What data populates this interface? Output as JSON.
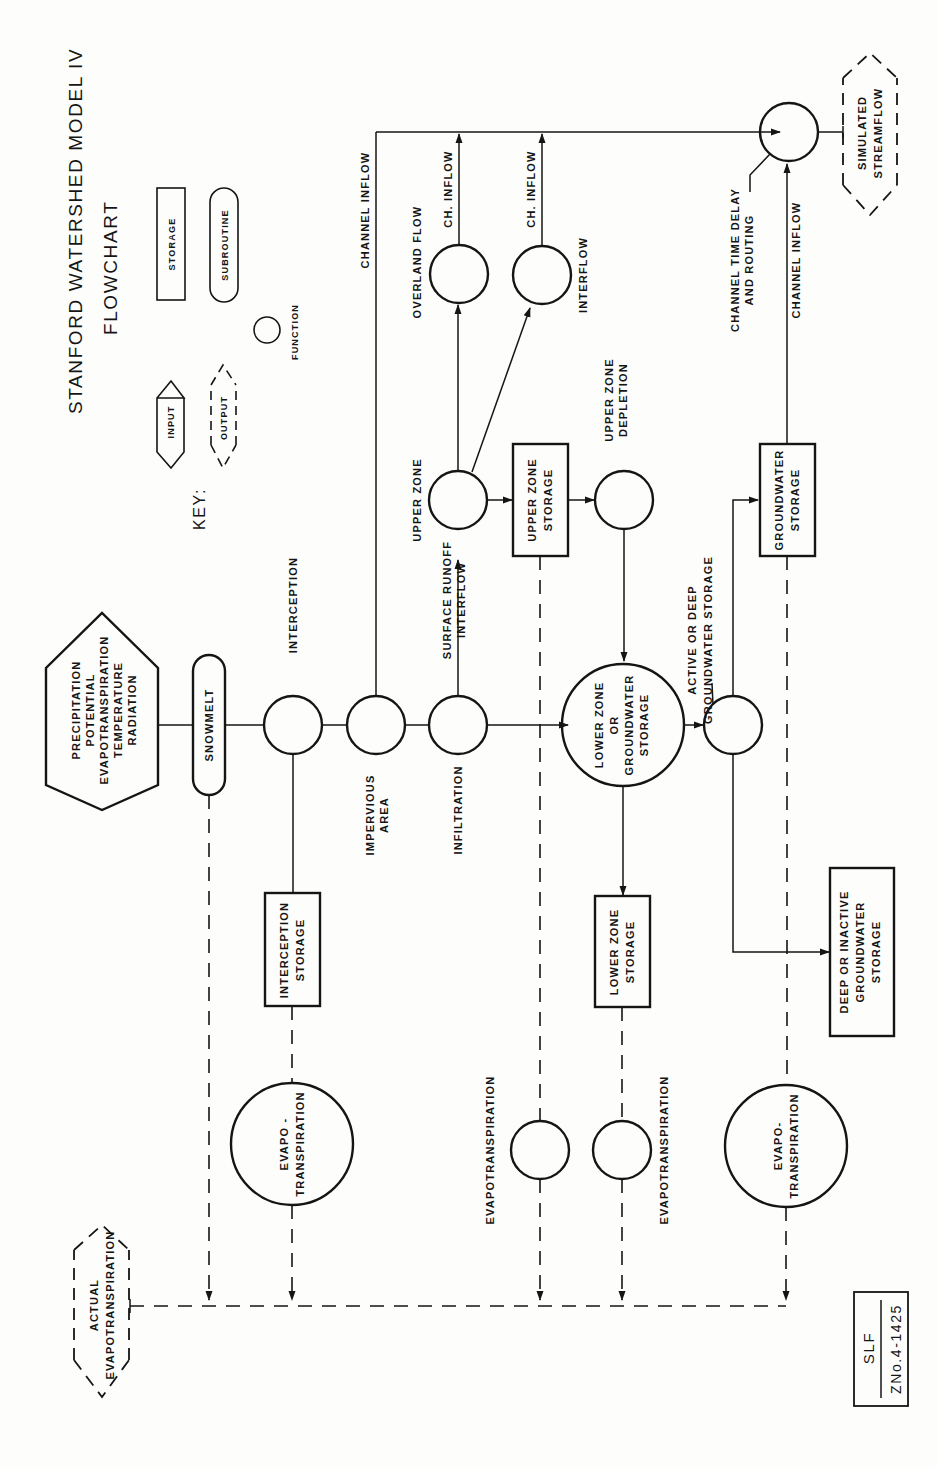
{
  "diagram": {
    "title": "STANFORD WATERSHED MODEL IV",
    "subtitle": "FLOWCHART",
    "stamp": {
      "line1": "SLF",
      "line2": "ZNo.4-1425"
    }
  },
  "key": {
    "label": "KEY:",
    "items": [
      {
        "shape": "hexagon",
        "label": "INPUT"
      },
      {
        "shape": "rectangle",
        "label": "STORAGE"
      },
      {
        "shape": "dashed-hexagon",
        "label": "OUTPUT"
      },
      {
        "shape": "rounded",
        "label": "SUBROUTINE"
      },
      {
        "shape": "circle",
        "label": "FUNCTION"
      }
    ]
  },
  "nodes": {
    "input": {
      "lines": [
        "PRECIPITATION",
        "POTENTIAL",
        "EVAPOTRANSPIRATION",
        "TEMPERATURE",
        "RADIATION"
      ]
    },
    "snowmelt": {
      "label": "SNOWMELT"
    },
    "interception": {
      "label": "INTERCEPTION"
    },
    "impervious": {
      "lines": [
        "IMPERVIOUS",
        "AREA"
      ]
    },
    "infiltration": {
      "label": "INFILTRATION"
    },
    "surface_runoff": {
      "lines": [
        "SURFACE RUNOFF",
        "INTERFLOW"
      ]
    },
    "upper_zone": {
      "label": "UPPER ZONE"
    },
    "upper_zone_storage": {
      "lines": [
        "UPPER ZONE",
        "STORAGE"
      ]
    },
    "upper_zone_depletion": {
      "lines": [
        "UPPER ZONE",
        "DEPLETION"
      ]
    },
    "overland_flow": {
      "label": "OVERLAND FLOW"
    },
    "interflow": {
      "label": "INTERFLOW"
    },
    "ch_inflow_1": {
      "label": "CH. INFLOW"
    },
    "ch_inflow_2": {
      "label": "CH. INFLOW"
    },
    "channel_inflow_top": {
      "label": "CHANNEL INFLOW"
    },
    "lower_zone": {
      "lines": [
        "LOWER ZONE",
        "OR",
        "GROUNDWATER",
        "STORAGE"
      ]
    },
    "active_deep": {
      "lines": [
        "ACTIVE OR DEEP",
        "GROUNDWATER STORAGE"
      ]
    },
    "groundwater_storage": {
      "lines": [
        "GROUNDWATER",
        "STORAGE"
      ]
    },
    "channel_inflow_right": {
      "label": "CHANNEL INFLOW"
    },
    "channel_routing": {
      "lines": [
        "CHANNEL TIME DELAY",
        "AND ROUTING"
      ]
    },
    "simulated_streamflow": {
      "lines": [
        "SIMULATED",
        "STREAMFLOW"
      ]
    },
    "interception_storage": {
      "lines": [
        "INTERCEPTION",
        "STORAGE"
      ]
    },
    "lower_zone_storage": {
      "lines": [
        "LOWER ZONE",
        "STORAGE"
      ]
    },
    "deep_inactive": {
      "lines": [
        "DEEP OR INACTIVE",
        "GROUNDWATER",
        "STORAGE"
      ]
    },
    "evapo_left": {
      "lines": [
        "EVAPO -",
        "TRANSPIRATION"
      ]
    },
    "evapo_mid1": {
      "label": "EVAPOTRANSPIRATION"
    },
    "evapo_mid2": {
      "label": "EVAPOTRANSPIRATION"
    },
    "evapo_right": {
      "lines": [
        "EVAPO-",
        "TRANSPIRATION"
      ]
    },
    "actual_et": {
      "lines": [
        "ACTUAL",
        "EVAPOTRANSPIRATION"
      ]
    }
  }
}
